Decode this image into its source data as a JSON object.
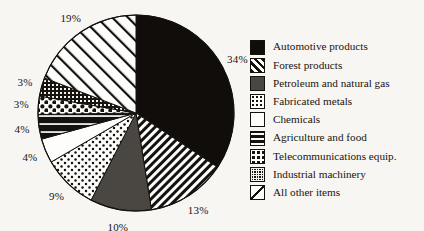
{
  "chart_data": {
    "type": "pie",
    "title": "",
    "categories": [
      "Automotive products",
      "Forest products",
      "Petroleum and natural gas",
      "Fabricated metals",
      "Chemicals",
      "Agriculture and food",
      "Telecommunications equip.",
      "Industrial machinery",
      "All other items"
    ],
    "values": [
      34,
      13,
      10,
      9,
      4,
      4,
      3,
      3,
      19
    ],
    "value_labels": [
      "34%",
      "13%",
      "10%",
      "9%",
      "4%",
      "4%",
      "3%",
      "3%",
      "19%"
    ],
    "units": "percent",
    "start_angle_deg": 0,
    "direction": "clockwise",
    "legend_position": "right",
    "grid": false,
    "xlabel": "",
    "ylabel": ""
  },
  "pie": {
    "slices": [
      {
        "label": "34%",
        "pattern": "solid-black",
        "value": 34
      },
      {
        "label": "13%",
        "pattern": "diagonal-hatch",
        "value": 13
      },
      {
        "label": "10%",
        "pattern": "solid-dark-gray",
        "value": 10
      },
      {
        "label": "9%",
        "pattern": "fine-dots",
        "value": 9
      },
      {
        "label": "4%",
        "pattern": "plain-white",
        "value": 4
      },
      {
        "label": "4%",
        "pattern": "horizontal-bands",
        "value": 4
      },
      {
        "label": "3%",
        "pattern": "polka-dots",
        "value": 3
      },
      {
        "label": "3%",
        "pattern": "dense-grid",
        "value": 3
      },
      {
        "label": "19%",
        "pattern": "wide-diagonal",
        "value": 19
      }
    ]
  },
  "legend": {
    "items": [
      {
        "label": "Automotive products",
        "pattern": "solid-black"
      },
      {
        "label": "Forest products",
        "pattern": "diagonal-hatch"
      },
      {
        "label": "Petroleum and natural gas",
        "pattern": "solid-dark-gray"
      },
      {
        "label": "Fabricated metals",
        "pattern": "fine-dots"
      },
      {
        "label": "Chemicals",
        "pattern": "plain-white"
      },
      {
        "label": "Agriculture and food",
        "pattern": "horizontal-bands"
      },
      {
        "label": "Telecommunications equip.",
        "pattern": "polka-dots"
      },
      {
        "label": "Industrial machinery",
        "pattern": "dense-grid"
      },
      {
        "label": "All other items",
        "pattern": "wide-diagonal"
      }
    ]
  },
  "colors": {
    "background": "#f7f6f3",
    "ink": "#17140f",
    "black_slice": "#100d0a",
    "dark_gray_slice": "#4a4642",
    "white_slice": "#fdfdfb"
  }
}
